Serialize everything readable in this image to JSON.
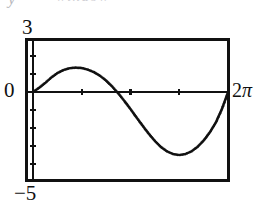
{
  "artifact": {
    "fragment_left": "y",
    "fragment_right": "window"
  },
  "figure": {
    "name": "calculator-sine-plot",
    "frame_color": "#111111",
    "curve_color": "#111111",
    "background": "#ffffff"
  },
  "labels": {
    "y_max": "3",
    "y_origin": "0",
    "y_min": "−5",
    "x_max_number": "2",
    "x_max_symbol": "π"
  },
  "chart_data": {
    "type": "line",
    "title": "",
    "subtitle": "",
    "xlabel": "",
    "ylabel": "",
    "grid": false,
    "legend_position": "none",
    "legend": [],
    "annotations": [],
    "xlim": [
      0,
      6.2832
    ],
    "ylim": [
      -5,
      3
    ],
    "xtick_labels": [
      "0",
      "2π"
    ],
    "ytick_labels": [
      "3",
      "0",
      "−5"
    ],
    "xticks_interior_count": 3,
    "yticks_interior_spacing": 1,
    "yticks_above_zero": 3,
    "yticks_below_zero": 5,
    "axis_x_value": 0,
    "axis_y_value": 0,
    "curve_style": "dotted-pixelated",
    "features": {
      "peak_x": 1.55,
      "peak_y": 1.35,
      "zero_crossing_x": 3.45,
      "trough_x": 4.6,
      "trough_y": -3.5,
      "end_x": 6.2832,
      "end_y": 0.0
    },
    "series": [
      {
        "name": "curve",
        "x": [
          0.0,
          0.1963,
          0.3927,
          0.589,
          0.7854,
          0.9817,
          1.1781,
          1.3744,
          1.5708,
          1.7671,
          1.9635,
          2.1598,
          2.3562,
          2.5525,
          2.7489,
          2.9452,
          3.1416,
          3.3379,
          3.5343,
          3.7306,
          3.927,
          4.1233,
          4.3197,
          4.516,
          4.7124,
          4.9087,
          5.1051,
          5.3014,
          5.4978,
          5.6941,
          5.8905,
          6.0868,
          6.2832
        ],
        "y": [
          0.0,
          0.23,
          0.5,
          0.8,
          1.05,
          1.22,
          1.32,
          1.35,
          1.33,
          1.24,
          1.1,
          0.9,
          0.63,
          0.3,
          -0.08,
          -0.5,
          -0.95,
          -1.42,
          -1.88,
          -2.32,
          -2.72,
          -3.06,
          -3.3,
          -3.45,
          -3.5,
          -3.45,
          -3.3,
          -3.05,
          -2.7,
          -2.25,
          -1.7,
          -0.95,
          -0.02
        ]
      }
    ]
  }
}
